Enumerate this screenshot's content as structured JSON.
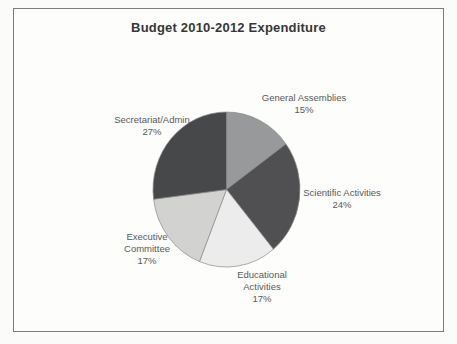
{
  "chart_data": {
    "type": "pie",
    "title": "Budget 2010-2012 Expenditure",
    "categories": [
      "General Assemblies",
      "Scientific Activities",
      "Educational Activities",
      "Executive Committee",
      "Secretariat/Admin"
    ],
    "values": [
      15,
      24,
      17,
      17,
      27
    ],
    "percent_labels": [
      "15%",
      "24%",
      "17%",
      "17%",
      "27%"
    ],
    "colors": [
      "#97999b",
      "#505052",
      "#ebeceb",
      "#d2d3d1",
      "#474849"
    ],
    "slice_border_color": "#8a8a8a",
    "start_angle_deg": 0,
    "direction": "clockwise",
    "legend": "none",
    "label_color": "#58595a",
    "title_color": "#373737",
    "frame_border_color": "#7b7b7b",
    "background_color": "#fdfdfc",
    "slice_labels": [
      {
        "lines": [
          "General Assemblies",
          "15%"
        ]
      },
      {
        "lines": [
          "Scientific Activities",
          "24%"
        ]
      },
      {
        "lines": [
          "Educational",
          "Activities",
          "17%"
        ]
      },
      {
        "lines": [
          "Executive",
          "Committee",
          "17%"
        ]
      },
      {
        "lines": [
          "Secretariat/Admin",
          "27%"
        ]
      }
    ]
  }
}
